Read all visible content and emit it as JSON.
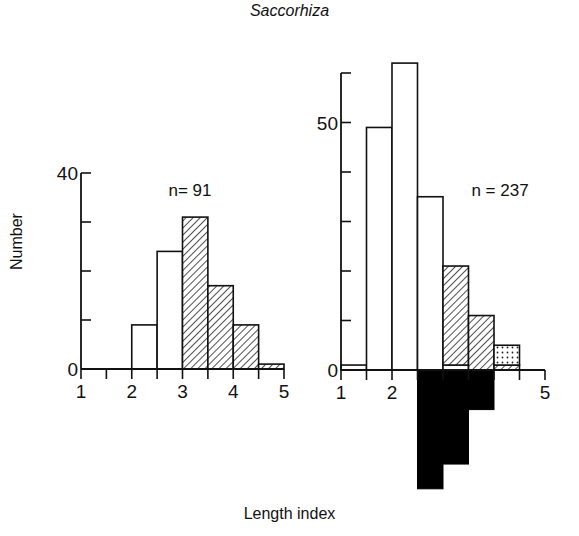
{
  "figure": {
    "title": "Saccorhiza",
    "xlabel": "Length index",
    "ylabel": "Number"
  },
  "chart_data": [
    {
      "type": "bar",
      "panel": "left",
      "title": "Saccorhiza",
      "annotation": "n = 91",
      "annotation_display": "n= 91",
      "xlabel": "Length index",
      "ylabel": "Number",
      "xlim": [
        1,
        5
      ],
      "ylim": [
        0,
        40
      ],
      "x_ticks": [
        1,
        1.5,
        2,
        2.5,
        3,
        3.5,
        4,
        4.5,
        5
      ],
      "x_tick_labels": [
        "1",
        "2",
        "3",
        "4",
        "5"
      ],
      "y_ticks": [
        0,
        10,
        20,
        30,
        40
      ],
      "y_tick_labels": [
        "0",
        "40"
      ],
      "bins": [
        [
          2,
          2.5
        ],
        [
          2.5,
          3
        ],
        [
          3,
          3.5
        ],
        [
          3.5,
          4
        ],
        [
          4,
          4.5
        ],
        [
          4.5,
          5
        ]
      ],
      "series": [
        {
          "name": "open",
          "pattern": "white",
          "values": [
            9,
            24,
            0,
            0,
            0,
            0
          ]
        },
        {
          "name": "hatched",
          "pattern": "hatch",
          "values": [
            0,
            0,
            31,
            17,
            9,
            1
          ]
        }
      ],
      "grid": false,
      "legend": "none"
    },
    {
      "type": "bar",
      "panel": "right",
      "annotation": "n = 237",
      "annotation_display": "n = 237",
      "xlabel": "Length index",
      "xlim": [
        1,
        5
      ],
      "ylim": [
        -25,
        62
      ],
      "x_ticks": [
        1,
        1.5,
        2,
        2.5,
        3,
        3.5,
        4,
        4.5,
        5
      ],
      "x_tick_labels": [
        "1",
        "2",
        "5"
      ],
      "y_ticks": [
        0,
        10,
        20,
        30,
        40,
        50,
        60
      ],
      "y_tick_labels": [
        "0",
        "50"
      ],
      "bins": [
        [
          1,
          1.5
        ],
        [
          1.5,
          2
        ],
        [
          2,
          2.5
        ],
        [
          2.5,
          3
        ],
        [
          3,
          3.5
        ],
        [
          3.5,
          4
        ],
        [
          4,
          4.5
        ]
      ],
      "series": [
        {
          "name": "open",
          "pattern": "white",
          "values": [
            1,
            49,
            62,
            35,
            1,
            0,
            0
          ]
        },
        {
          "name": "hatched",
          "pattern": "hatch",
          "values": [
            0,
            0,
            0,
            0,
            20,
            11,
            1
          ]
        },
        {
          "name": "dotted",
          "pattern": "dots",
          "values": [
            0,
            0,
            0,
            0,
            0,
            0,
            4
          ]
        },
        {
          "name": "solid (below axis)",
          "pattern": "black",
          "values": [
            0,
            0,
            0,
            -24,
            -19,
            -8,
            0
          ]
        }
      ],
      "grid": false,
      "legend": "none"
    }
  ]
}
